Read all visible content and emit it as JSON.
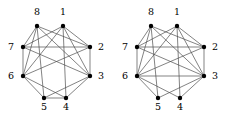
{
  "figure": {
    "title": "",
    "width": 228,
    "height": 115,
    "background": "#ffffff",
    "edge_color": "#4d4d4d",
    "vertex_color": "#000000",
    "label_color": "#000000",
    "vertex_radius": 2.2,
    "edge_width": 0.7
  },
  "graphs": [
    {
      "name": "graph-left",
      "origin_x": 0,
      "vertices": [
        {
          "id": "1",
          "label": "1",
          "x": 63,
          "y": 26,
          "label_x": 63,
          "label_y": 15,
          "anchor": "middle"
        },
        {
          "id": "2",
          "label": "2",
          "x": 90,
          "y": 47,
          "label_x": 101,
          "label_y": 50,
          "anchor": "middle"
        },
        {
          "id": "3",
          "label": "3",
          "x": 90,
          "y": 76,
          "label_x": 101,
          "label_y": 79,
          "anchor": "middle"
        },
        {
          "id": "4",
          "label": "4",
          "x": 66,
          "y": 98,
          "label_x": 66,
          "label_y": 110,
          "anchor": "middle"
        },
        {
          "id": "5",
          "label": "5",
          "x": 44,
          "y": 98,
          "label_x": 44,
          "label_y": 110,
          "anchor": "middle"
        },
        {
          "id": "6",
          "label": "6",
          "x": 23,
          "y": 76,
          "label_x": 11,
          "label_y": 79,
          "anchor": "middle"
        },
        {
          "id": "7",
          "label": "7",
          "x": 23,
          "y": 47,
          "label_x": 11,
          "label_y": 50,
          "anchor": "middle"
        },
        {
          "id": "8",
          "label": "8",
          "x": 37,
          "y": 26,
          "label_x": 37,
          "label_y": 15,
          "anchor": "middle"
        }
      ],
      "edges": [
        [
          "8",
          "7"
        ],
        [
          "8",
          "6"
        ],
        [
          "8",
          "5"
        ],
        [
          "8",
          "3"
        ],
        [
          "8",
          "2"
        ],
        [
          "1",
          "2"
        ],
        [
          "1",
          "3"
        ],
        [
          "1",
          "4"
        ],
        [
          "1",
          "6"
        ],
        [
          "1",
          "7"
        ],
        [
          "7",
          "2"
        ],
        [
          "7",
          "6"
        ],
        [
          "7",
          "3"
        ],
        [
          "2",
          "3"
        ],
        [
          "2",
          "6"
        ],
        [
          "6",
          "5"
        ],
        [
          "6",
          "4"
        ],
        [
          "3",
          "4"
        ],
        [
          "3",
          "5"
        ],
        [
          "5",
          "4"
        ]
      ]
    },
    {
      "name": "graph-right",
      "origin_x": 114,
      "vertices": [
        {
          "id": "1",
          "label": "1",
          "x": 63,
          "y": 26,
          "label_x": 63,
          "label_y": 15,
          "anchor": "middle"
        },
        {
          "id": "2",
          "label": "2",
          "x": 90,
          "y": 47,
          "label_x": 101,
          "label_y": 50,
          "anchor": "middle"
        },
        {
          "id": "3",
          "label": "3",
          "x": 90,
          "y": 76,
          "label_x": 101,
          "label_y": 79,
          "anchor": "middle"
        },
        {
          "id": "4",
          "label": "4",
          "x": 66,
          "y": 98,
          "label_x": 66,
          "label_y": 110,
          "anchor": "middle"
        },
        {
          "id": "5",
          "label": "5",
          "x": 44,
          "y": 98,
          "label_x": 44,
          "label_y": 110,
          "anchor": "middle"
        },
        {
          "id": "6",
          "label": "6",
          "x": 23,
          "y": 76,
          "label_x": 11,
          "label_y": 79,
          "anchor": "middle"
        },
        {
          "id": "7",
          "label": "7",
          "x": 23,
          "y": 47,
          "label_x": 11,
          "label_y": 50,
          "anchor": "middle"
        },
        {
          "id": "8",
          "label": "8",
          "x": 37,
          "y": 26,
          "label_x": 37,
          "label_y": 15,
          "anchor": "middle"
        }
      ],
      "edges": [
        [
          "8",
          "7"
        ],
        [
          "8",
          "6"
        ],
        [
          "8",
          "5"
        ],
        [
          "8",
          "3"
        ],
        [
          "8",
          "2"
        ],
        [
          "1",
          "2"
        ],
        [
          "1",
          "3"
        ],
        [
          "1",
          "4"
        ],
        [
          "1",
          "6"
        ],
        [
          "1",
          "7"
        ],
        [
          "7",
          "2"
        ],
        [
          "7",
          "6"
        ],
        [
          "7",
          "3"
        ],
        [
          "2",
          "3"
        ],
        [
          "2",
          "6"
        ],
        [
          "6",
          "5"
        ],
        [
          "6",
          "4"
        ],
        [
          "6",
          "3"
        ],
        [
          "3",
          "4"
        ],
        [
          "3",
          "5"
        ]
      ]
    }
  ]
}
